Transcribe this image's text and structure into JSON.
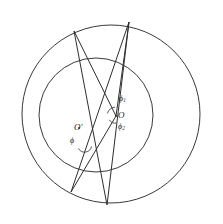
{
  "figure": {
    "background_color": "#ffffff",
    "stroke_color": "#3a3a3a",
    "width": 223,
    "height": 224,
    "circles": [
      {
        "name": "outer-circle",
        "cx": 111,
        "cy": 114,
        "r": 89,
        "label": ""
      },
      {
        "name": "inner-circle",
        "cx": 96,
        "cy": 115,
        "r": 57,
        "label": ""
      }
    ],
    "points": [
      {
        "name": "center-o",
        "label": "O",
        "x": 116,
        "y": 116
      },
      {
        "name": "center-o-prime",
        "label": "O′",
        "x": 79,
        "y": 128
      },
      {
        "name": "vertex-top-left",
        "label": "",
        "x": 74,
        "y": 31
      },
      {
        "name": "vertex-top-right",
        "label": "",
        "x": 129,
        "y": 22
      },
      {
        "name": "vertex-bottom-left",
        "label": "",
        "x": 71,
        "y": 192
      },
      {
        "name": "vertex-bottom-right",
        "label": "",
        "x": 107,
        "y": 205
      }
    ],
    "chords": [
      {
        "name": "chord-a",
        "x1": 74,
        "y1": 31,
        "x2": 107,
        "y2": 205
      },
      {
        "name": "chord-b",
        "x1": 129,
        "y1": 22,
        "x2": 71,
        "y2": 192
      },
      {
        "name": "chord-c",
        "x1": 74,
        "y1": 31,
        "x2": 116,
        "y2": 116
      },
      {
        "name": "chord-d",
        "x1": 129,
        "y1": 22,
        "x2": 116,
        "y2": 116
      },
      {
        "name": "chord-e",
        "x1": 116,
        "y1": 116,
        "x2": 71,
        "y2": 192
      },
      {
        "name": "chord-f",
        "x1": 129,
        "y1": 22,
        "x2": 107,
        "y2": 205
      }
    ],
    "angle_labels": [
      {
        "name": "angle-phi",
        "label": "ϕ",
        "sub": "",
        "x": 73,
        "y": 141
      },
      {
        "name": "angle-phi-1",
        "label": "ϕ",
        "sub": "1",
        "x": 122,
        "y": 98
      },
      {
        "name": "angle-phi-2",
        "label": "ϕ",
        "sub": "2",
        "x": 121,
        "y": 126
      }
    ],
    "angle_arcs": [
      {
        "name": "arc-phi",
        "cx": 85,
        "cy": 146,
        "r": 7
      },
      {
        "name": "arc-phi-1",
        "cx": 116,
        "cy": 116,
        "r": 9
      },
      {
        "name": "arc-phi-2",
        "cx": 116,
        "cy": 116,
        "r": 7
      }
    ]
  }
}
